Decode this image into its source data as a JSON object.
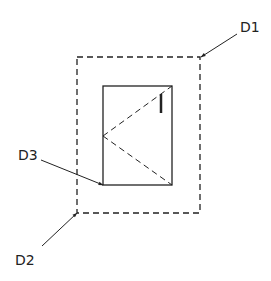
{
  "diagram": {
    "stroke_color": "#222222",
    "background": "#ffffff",
    "outer_frame": {
      "style": "dashed",
      "x": 77,
      "y": 57,
      "width": 123,
      "height": 156
    },
    "inner_frame": {
      "style": "solid",
      "x": 103,
      "y": 86,
      "width": 69,
      "height": 99
    },
    "hinge_lines": {
      "style": "dashed",
      "apex": {
        "x": 103,
        "y": 136
      },
      "to_top_right": {
        "x": 172,
        "y": 86
      },
      "to_bottom_right": {
        "x": 172,
        "y": 185
      }
    },
    "handle": {
      "x": 161,
      "y1": 94,
      "y2": 113
    },
    "labels": [
      {
        "id": "D1",
        "text": "D1",
        "x": 240,
        "y": 32,
        "leader_from": {
          "x": 237,
          "y": 34
        },
        "leader_to": {
          "x": 201,
          "y": 57
        }
      },
      {
        "id": "D2",
        "text": "D2",
        "x": 15,
        "y": 265,
        "leader_from": {
          "x": 42,
          "y": 246
        },
        "leader_to": {
          "x": 77,
          "y": 213
        }
      },
      {
        "id": "D3",
        "text": "D3",
        "x": 18,
        "y": 160,
        "leader_from": {
          "x": 41,
          "y": 160
        },
        "leader_to": {
          "x": 103,
          "y": 185
        }
      }
    ]
  }
}
